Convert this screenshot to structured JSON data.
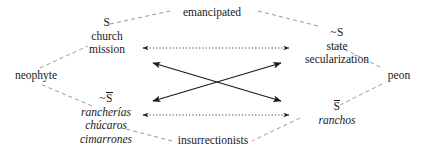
{
  "diagram": {
    "type": "semiotic-square",
    "nodes": {
      "s": {
        "symbol": "S",
        "lines": [
          "church",
          "mission"
        ]
      },
      "not_s": {
        "symbol": "~S",
        "lines": [
          "state",
          "secularization"
        ]
      },
      "not_s_bar": {
        "symbol_prefix": "~",
        "symbol": "S",
        "lines": [
          "rancherías",
          "chúcaros",
          "cimarrones"
        ]
      },
      "s_bar": {
        "symbol": "S",
        "lines": [
          "ranchos"
        ]
      }
    },
    "vertices": {
      "top": "emancipated",
      "bottom": "insurrectionists",
      "left": "neophyte",
      "right": "peon"
    },
    "relations": [
      {
        "name": "contrariety-top",
        "style": "dotted",
        "arrow": "double"
      },
      {
        "name": "contrariety-bottom",
        "style": "dotted",
        "arrow": "double"
      },
      {
        "name": "contradiction-descending",
        "style": "solid",
        "arrow": "double"
      },
      {
        "name": "contradiction-ascending",
        "style": "solid",
        "arrow": "double"
      }
    ],
    "colors": {
      "ink": "#1a1a1a",
      "background": "#ffffff",
      "dashed_edge": "#8c8c8c"
    }
  }
}
